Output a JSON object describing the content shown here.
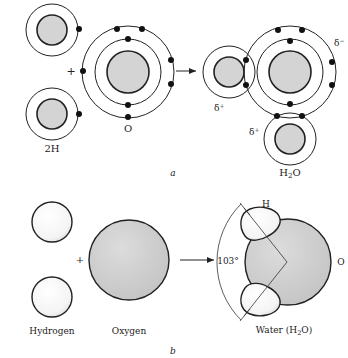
{
  "panel_a": {
    "caption": "a",
    "reactant_hydrogen_label": "2H",
    "reactant_oxygen_label": "O",
    "plus": "+",
    "product_label_main": "H",
    "product_label_sub": "2",
    "product_label_end": "O",
    "delta_plus_1": "δ",
    "delta_plus_2": "δ",
    "delta_minus": "δ",
    "sup_plus": "+",
    "sup_minus": "−"
  },
  "panel_b": {
    "caption": "b",
    "plus": "+",
    "hydrogen_label": "Hydrogen",
    "oxygen_label": "Oxygen",
    "water_label_main": "Water (H",
    "water_label_sub": "2",
    "water_label_end": "O)",
    "angle_label": "103°",
    "h_label": "H",
    "o_label": "O"
  },
  "colors": {
    "nucleus_fill": "#d4d4d4",
    "stroke": "#222222",
    "electron": "#111111",
    "background": "#ffffff"
  }
}
